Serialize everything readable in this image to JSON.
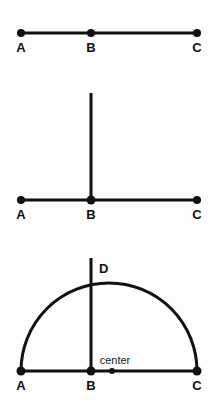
{
  "figure": {
    "background_color": "#fdfdfd",
    "stroke_color": "#111111",
    "label_color": "#111111",
    "width": 216,
    "height": 407
  },
  "panels": [
    {
      "id": "panel-segment",
      "name": "collinear-points-segment",
      "baseline_y": 33,
      "points": [
        {
          "id": "A",
          "label": "A",
          "x": 21,
          "y": 33,
          "label_x": 21,
          "label_y": 52,
          "dot": true
        },
        {
          "id": "B",
          "label": "B",
          "x": 91,
          "y": 33,
          "label_x": 91,
          "label_y": 52,
          "dot": true
        },
        {
          "id": "C",
          "label": "C",
          "x": 197,
          "y": 33,
          "label_x": 197,
          "label_y": 52,
          "dot": true
        }
      ],
      "segments": [
        {
          "id": "AC",
          "x1": 21,
          "y1": 33,
          "x2": 197,
          "y2": 33,
          "width": 3
        }
      ],
      "verticals": [],
      "arcs": []
    },
    {
      "id": "panel-perpendicular",
      "name": "perpendicular-at-b",
      "baseline_y": 200,
      "points": [
        {
          "id": "A",
          "label": "A",
          "x": 21,
          "y": 200,
          "label_x": 21,
          "label_y": 219,
          "dot": true
        },
        {
          "id": "B",
          "label": "B",
          "x": 91,
          "y": 200,
          "label_x": 91,
          "label_y": 219,
          "dot": true
        },
        {
          "id": "C",
          "label": "C",
          "x": 197,
          "y": 200,
          "label_x": 197,
          "label_y": 219,
          "dot": true
        }
      ],
      "segments": [
        {
          "id": "AC",
          "x1": 21,
          "y1": 200,
          "x2": 197,
          "y2": 200,
          "width": 3
        }
      ],
      "verticals": [
        {
          "id": "B-vertical",
          "x": 91,
          "y1": 93,
          "y2": 200,
          "width": 3
        }
      ],
      "arcs": []
    },
    {
      "id": "panel-semicircle",
      "name": "semicircle-with-center",
      "baseline_y": 371,
      "points": [
        {
          "id": "A",
          "label": "A",
          "x": 21,
          "y": 371,
          "label_x": 21,
          "label_y": 390,
          "dot": true
        },
        {
          "id": "B",
          "label": "B",
          "x": 91,
          "y": 371,
          "label_x": 91,
          "label_y": 390,
          "dot": true
        },
        {
          "id": "C",
          "label": "C",
          "x": 197,
          "y": 371,
          "label_x": 197,
          "label_y": 390,
          "dot": true
        }
      ],
      "segments": [
        {
          "id": "AC",
          "x1": 21,
          "y1": 371,
          "x2": 197,
          "y2": 371,
          "width": 3
        }
      ],
      "verticals": [
        {
          "id": "BD-vertical",
          "x": 91,
          "y1": 258,
          "y2": 371,
          "width": 3
        }
      ],
      "arcs": [
        {
          "id": "semicircle-AC",
          "cx": 109,
          "cy": 371,
          "r": 88,
          "start_x": 21,
          "start_y": 371,
          "end_x": 197,
          "end_y": 371,
          "width": 3
        }
      ],
      "apex_label": {
        "id": "D",
        "label": "D",
        "x": 99,
        "y": 273
      },
      "center_marker": {
        "id": "center",
        "label": "center",
        "dot_x": 112,
        "dot_y": 371,
        "dot_r": 3,
        "label_x": 115,
        "label_y": 364
      }
    }
  ]
}
